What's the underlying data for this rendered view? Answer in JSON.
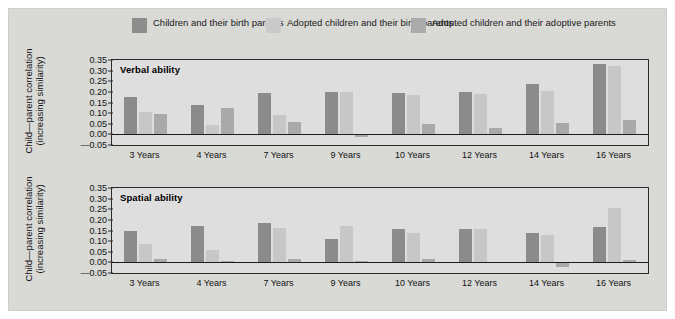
{
  "legend": {
    "items": [
      {
        "label_line1": "Children",
        "label_line2": "and their birth parents",
        "color": "#8b8b8b",
        "swatch_name": "legend-swatch-children-birth"
      },
      {
        "label_line1": "Adopted children",
        "label_line2": "and their birth parents",
        "color": "#c7c7c7",
        "swatch_name": "legend-swatch-adopted-birth"
      },
      {
        "label_line1": "Adopted children",
        "label_line2": "and their adoptive parents",
        "color": "#a9a9a9",
        "swatch_name": "legend-swatch-adopted-adoptive"
      }
    ]
  },
  "axis": {
    "ylabel_line1": "Child—parent correlation",
    "ylabel_line2": "(increasing similarity)",
    "yticks": [
      "0.35",
      "0.30",
      "0.25",
      "0.20",
      "0.15",
      "0.10",
      "0.05",
      "0.00",
      "—0.05"
    ]
  },
  "chart_data": [
    {
      "type": "bar",
      "title": "Verbal ability",
      "xlabel": "",
      "ylabel": "Child—parent correlation (increasing similarity)",
      "ylim": [
        -0.05,
        0.35
      ],
      "ytick_values": [
        0.35,
        0.3,
        0.25,
        0.2,
        0.15,
        0.1,
        0.05,
        0.0,
        -0.05
      ],
      "grid": false,
      "legend_position": "top",
      "categories": [
        "3 Years",
        "4 Years",
        "7 Years",
        "9 Years",
        "10 Years",
        "12 Years",
        "14 Years",
        "16 Years"
      ],
      "series": [
        {
          "name": "Children and their birth parents",
          "color": "#8b8b8b",
          "values": [
            0.175,
            0.137,
            0.195,
            0.2,
            0.195,
            0.2,
            0.235,
            0.33
          ]
        },
        {
          "name": "Adopted children and their birth parents",
          "color": "#c7c7c7",
          "values": [
            0.105,
            0.045,
            0.09,
            0.2,
            0.185,
            0.19,
            0.205,
            0.32
          ]
        },
        {
          "name": "Adopted children and their adoptive parents",
          "color": "#a9a9a9",
          "values": [
            0.095,
            0.125,
            0.06,
            -0.01,
            0.05,
            0.03,
            0.055,
            0.07
          ]
        }
      ]
    },
    {
      "type": "bar",
      "title": "Spatial ability",
      "xlabel": "",
      "ylabel": "Child—parent correlation (increasing similarity)",
      "ylim": [
        -0.05,
        0.35
      ],
      "ytick_values": [
        0.35,
        0.3,
        0.25,
        0.2,
        0.15,
        0.1,
        0.05,
        0.0,
        -0.05
      ],
      "grid": false,
      "legend_position": "top",
      "categories": [
        "3 Years",
        "4 Years",
        "7 Years",
        "9 Years",
        "10 Years",
        "12 Years",
        "14 Years",
        "16 Years"
      ],
      "series": [
        {
          "name": "Children and their birth parents",
          "color": "#8b8b8b",
          "values": [
            0.15,
            0.17,
            0.187,
            0.11,
            0.155,
            0.155,
            0.14,
            0.165
          ]
        },
        {
          "name": "Adopted children and their birth parents",
          "color": "#c7c7c7",
          "values": [
            0.085,
            0.06,
            0.162,
            0.173,
            0.14,
            0.155,
            0.13,
            0.255
          ]
        },
        {
          "name": "Adopted children and their adoptive parents",
          "color": "#a9a9a9",
          "values": [
            0.015,
            0.008,
            0.018,
            0.005,
            0.015,
            0.0,
            -0.02,
            0.01
          ]
        }
      ]
    }
  ]
}
